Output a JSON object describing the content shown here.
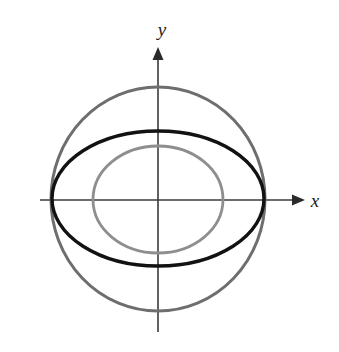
{
  "figure": {
    "title": "",
    "background_color": "#ffffff",
    "width": 339,
    "height": 352
  },
  "axes": {
    "x_axis": {
      "label": "x",
      "label_style": "italic-serif",
      "color": "#3a3a3a",
      "arrow": "right",
      "y_pixel": 200,
      "x_start": 40,
      "x_end": 300
    },
    "y_axis": {
      "label": "y",
      "label_style": "italic-serif",
      "color": "#3a3a3a",
      "arrow": "up",
      "x_pixel": 158,
      "y_start": 332,
      "y_end": 48
    },
    "origin": {
      "x": 158,
      "y": 200
    }
  },
  "chart_data": {
    "type": "scatter",
    "title": "",
    "xlabel": "x",
    "ylabel": "y",
    "grid": false,
    "legend": "none",
    "axis_style": "arrow-cross",
    "xlim": [
      -1.35,
      1.35
    ],
    "ylim": [
      -1.4,
      1.4
    ],
    "annotations": [],
    "series": [
      {
        "name": "outer-circle",
        "shape": "circle",
        "color": "#6e6e6e",
        "line_width": 3,
        "center": [
          0,
          0
        ],
        "radius_x_px": 107,
        "radius_y_px": 112,
        "left_crossing_px": 51,
        "right_crossing_px": 265,
        "top_px": 87,
        "bottom_px": 311
      },
      {
        "name": "ellipse",
        "shape": "ellipse",
        "color": "#121212",
        "line_width": 3.4,
        "center": [
          0,
          0
        ],
        "radius_x_px": 106,
        "radius_y_px": 68,
        "left_crossing_px": 52,
        "right_crossing_px": 264,
        "top_px": 131,
        "bottom_px": 266
      },
      {
        "name": "inner-circle",
        "shape": "circle",
        "color": "#8e8e8e",
        "line_width": 2.8,
        "center": [
          0,
          0
        ],
        "radius_x_px": 65,
        "radius_y_px": 54,
        "left_crossing_px": 93,
        "right_crossing_px": 223,
        "top_px": 146,
        "bottom_px": 253
      }
    ]
  }
}
